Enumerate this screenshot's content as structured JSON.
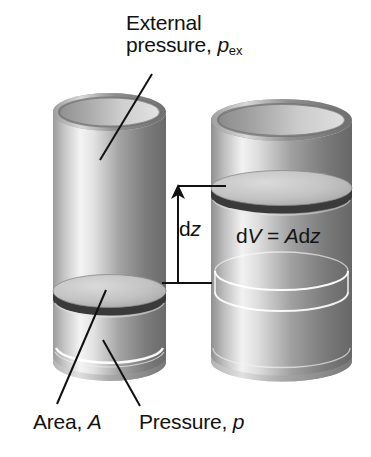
{
  "figure": {
    "width": 371,
    "height": 457,
    "background": "#ffffff"
  },
  "labels": {
    "external_pressure": {
      "line1": "External",
      "line2_prefix": "pressure, ",
      "symbol": "p",
      "subscript": "ex"
    },
    "dz": {
      "d": "d",
      "symbol": "z"
    },
    "dv_equation": {
      "d1": "d",
      "v": "V",
      "equals": " = ",
      "a": "A",
      "d2": "d",
      "z": "z"
    },
    "area": {
      "text": "Area, ",
      "symbol": "A"
    },
    "pressure": {
      "text": "Pressure, ",
      "symbol": "p"
    }
  },
  "cylinders": [
    {
      "name": "left-cylinder",
      "state": "initial",
      "x_left": 53,
      "x_right": 166,
      "top_rim_y": 112,
      "bottom_y": 380,
      "piston_center_y": 291,
      "gas_level_y": 352
    },
    {
      "name": "right-cylinder",
      "state": "expanded",
      "x_left": 211,
      "x_right": 352,
      "top_rim_y": 120,
      "bottom_y": 380,
      "piston_center_y": 188,
      "gas_level_y": 277
    }
  ],
  "annotations": {
    "dz_arrow": {
      "kind": "dimension-arrow",
      "orientation": "vertical",
      "top_y": 186,
      "bottom_y": 283,
      "x": 178,
      "arrowhead": "top"
    },
    "leader_lines": [
      {
        "name": "external-pressure-leader",
        "x1": 152,
        "y1": 74,
        "x2": 100,
        "y2": 160
      },
      {
        "name": "area-leader",
        "x1": 106,
        "y1": 290,
        "x2": 57,
        "y2": 404
      },
      {
        "name": "pressure-leader",
        "x1": 103,
        "y1": 340,
        "x2": 140,
        "y2": 406
      }
    ]
  },
  "colors": {
    "ink": "#111111",
    "metal_light": "#f2f2f2",
    "metal_mid": "#b8b8b8",
    "metal_dark": "#6e6e6e",
    "metal_darkest": "#4a4a4a",
    "piston_face": "#c9c9c9",
    "piston_edge": "#333333",
    "gas_line": "#ffffff",
    "background": "#ffffff"
  }
}
